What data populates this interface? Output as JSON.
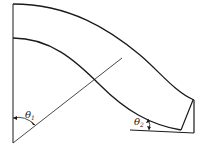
{
  "diagram": {
    "type": "curved channel / blade passage geometry",
    "labels": {
      "theta1": {
        "symbol": "θ",
        "subscript": "1"
      },
      "theta2": {
        "symbol": "θ",
        "subscript": "2"
      }
    },
    "colors": {
      "stroke": "#1a1a1a",
      "background": "#ffffff"
    }
  }
}
